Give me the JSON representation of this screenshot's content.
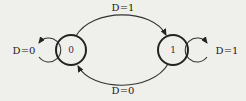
{
  "diagram": {
    "type": "state-transition",
    "states": [
      {
        "id": "s0",
        "label": "0"
      },
      {
        "id": "s1",
        "label": "1"
      }
    ],
    "transitions": [
      {
        "from": "s0",
        "to": "s0",
        "var": "D",
        "value": "0",
        "label": "D=0"
      },
      {
        "from": "s0",
        "to": "s1",
        "var": "D",
        "value": "1",
        "label": "D=1"
      },
      {
        "from": "s1",
        "to": "s1",
        "var": "D",
        "value": "1",
        "label": "D=1"
      },
      {
        "from": "s1",
        "to": "s0",
        "var": "D",
        "value": "0",
        "label": "D=0"
      }
    ]
  }
}
